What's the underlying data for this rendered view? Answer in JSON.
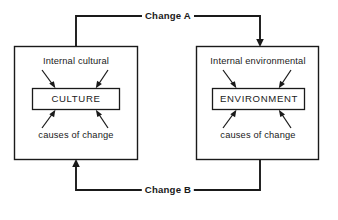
{
  "diagram": {
    "colors": {
      "line": "#1a1a1a",
      "background": "#ffffff"
    },
    "left_box": {
      "top_label": "Internal cultural",
      "inner_label": "CULTURE",
      "bottom_label": "causes of change"
    },
    "right_box": {
      "top_label": "Internal environmental",
      "inner_label": "ENVIRONMENT",
      "bottom_label": "causes of change"
    },
    "connectors": [
      {
        "label": "Change A",
        "from": "CULTURE",
        "to": "ENVIRONMENT",
        "position": "top"
      },
      {
        "label": "Change B",
        "from": "ENVIRONMENT",
        "to": "CULTURE",
        "position": "bottom"
      }
    ]
  }
}
